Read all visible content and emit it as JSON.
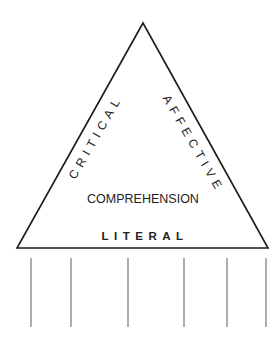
{
  "diagram": {
    "type": "comprehension-triangle",
    "apex_label": "",
    "left_side_label": "CRITICAL",
    "right_side_label": "AFFECTIVE",
    "center_label": "COMPREHENSION",
    "base_label": "LITERAL",
    "support_lines_count": 6
  },
  "colors": {
    "stroke": "#1a1a1a",
    "support_lines": "#777777",
    "text": "#222222",
    "background": "#ffffff"
  }
}
